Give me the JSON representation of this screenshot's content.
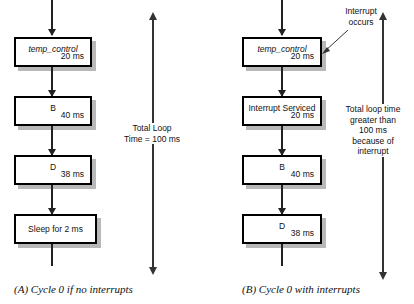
{
  "figure": {
    "panels": [
      {
        "id": "panel-a",
        "caption": "(A) Cycle 0 if no interrupts",
        "blocks": [
          {
            "name": "temp_control",
            "time": "20 ms",
            "italic": true,
            "single_line": false
          },
          {
            "name": "B",
            "time": "40 ms",
            "italic": false,
            "single_line": false
          },
          {
            "name": "D",
            "time": "38 ms",
            "italic": false,
            "single_line": false
          },
          {
            "name": "Sleep for 2 ms",
            "time": "",
            "italic": false,
            "single_line": true
          }
        ],
        "measure_note": "Total Loop\nTime = 100 ms"
      },
      {
        "id": "panel-b",
        "caption": "(B) Cycle 0 with interrupts",
        "blocks": [
          {
            "name": "temp_control",
            "time": "20 ms",
            "italic": true,
            "single_line": false
          },
          {
            "name": "Interrupt Serviced",
            "time": "20 ms",
            "italic": false,
            "single_line": false
          },
          {
            "name": "B",
            "time": "40 ms",
            "italic": false,
            "single_line": false
          },
          {
            "name": "D",
            "time": "38 ms",
            "italic": false,
            "single_line": false
          }
        ],
        "measure_note": "Total loop time\ngreater than\n100 ms\nbecause of\ninterrupt",
        "callout": "Interrupt\noccurs"
      }
    ],
    "colors": {
      "stroke": "#000000",
      "shadow": "#b8b8b8",
      "arrow": "#333333",
      "background": "#ffffff",
      "text": "#111111"
    }
  }
}
